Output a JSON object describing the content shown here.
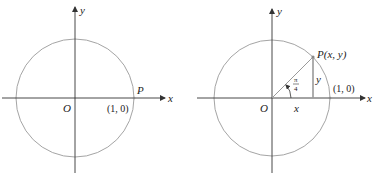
{
  "figure_left": {
    "axis_x_label": "x",
    "axis_y_label": "y",
    "origin_label": "O",
    "point_label": "P",
    "point_coord_label": "(1, 0)"
  },
  "figure_right": {
    "axis_x_label": "x",
    "axis_y_label": "y",
    "origin_label": "O",
    "point_label": "P(x, y)",
    "unit_point_label": "(1, 0)",
    "angle_numerator": "π",
    "angle_denominator": "4",
    "horizontal_leg_label": "x",
    "vertical_leg_label": "y"
  },
  "colors": {
    "axis": "#333333",
    "circle": "#9a9a9a",
    "segment": "#9a9a9a",
    "text": "#222222"
  }
}
